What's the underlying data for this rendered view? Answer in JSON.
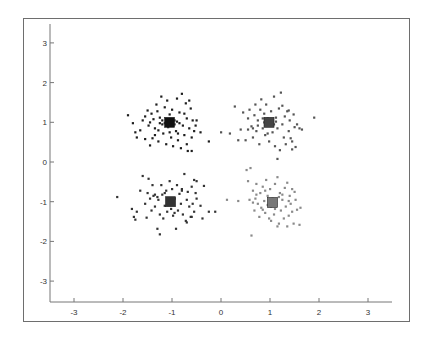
{
  "chart_data": {
    "type": "scatter",
    "title": "",
    "xlabel": "",
    "ylabel": "",
    "xlim": [
      -3.5,
      3.5
    ],
    "ylim": [
      -3.5,
      3.5
    ],
    "grid": false,
    "legend": "none",
    "x_ticks": [
      "-3",
      "-2",
      "-1",
      "0",
      "1",
      "2",
      "3"
    ],
    "y_ticks": [
      "3",
      "2",
      "1",
      "0",
      "-1",
      "-2",
      "-3"
    ],
    "x_tick_values": [
      -3,
      -2,
      -1,
      0,
      1,
      2,
      3
    ],
    "y_tick_values": [
      3,
      2,
      1,
      0,
      -1,
      -2,
      -3
    ],
    "series": [
      {
        "name": "cluster-top-left",
        "color": "#1e1e1e",
        "centroid": {
          "x": -1.05,
          "y": 1.0,
          "color": "#111111"
        },
        "points": [
          [
            -1.9,
            1.18
          ],
          [
            -1.8,
            0.98
          ],
          [
            -1.75,
            0.75
          ],
          [
            -1.72,
            0.62
          ],
          [
            -1.65,
            0.8
          ],
          [
            -1.6,
            1.05
          ],
          [
            -1.55,
            1.15
          ],
          [
            -1.5,
            1.3
          ],
          [
            -1.48,
            0.92
          ],
          [
            -1.45,
            0.42
          ],
          [
            -1.42,
            1.22
          ],
          [
            -1.4,
            0.6
          ],
          [
            -1.38,
            1.08
          ],
          [
            -1.35,
            0.85
          ],
          [
            -1.32,
            1.45
          ],
          [
            -1.3,
            1.28
          ],
          [
            -1.28,
            0.52
          ],
          [
            -1.25,
            1.12
          ],
          [
            -1.22,
            1.65
          ],
          [
            -1.2,
            0.95
          ],
          [
            -1.18,
            0.72
          ],
          [
            -1.15,
            1.38
          ],
          [
            -1.12,
            0.45
          ],
          [
            -1.1,
            1.55
          ],
          [
            -1.08,
            0.88
          ],
          [
            -1.05,
            1.2
          ],
          [
            -1.02,
            0.62
          ],
          [
            -1.0,
            1.32
          ],
          [
            -0.98,
            0.4
          ],
          [
            -0.95,
            1.05
          ],
          [
            -0.92,
            0.78
          ],
          [
            -0.9,
            1.6
          ],
          [
            -0.88,
            0.55
          ],
          [
            -0.85,
            1.25
          ],
          [
            -0.82,
            0.35
          ],
          [
            -0.8,
            1.72
          ],
          [
            -0.78,
            0.92
          ],
          [
            -0.75,
            0.68
          ],
          [
            -0.72,
            1.48
          ],
          [
            -0.7,
            1.1
          ],
          [
            -0.68,
            0.28
          ],
          [
            -0.65,
            0.85
          ],
          [
            -0.62,
            1.35
          ],
          [
            -0.6,
            0.62
          ],
          [
            -0.58,
            1.05
          ],
          [
            -0.55,
            0.78
          ],
          [
            -0.52,
            0.92
          ],
          [
            -0.5,
            1.05
          ],
          [
            -0.42,
            0.75
          ],
          [
            -0.25,
            0.52
          ],
          [
            -1.25,
            0.98
          ],
          [
            -1.15,
            0.98
          ],
          [
            -1.12,
            1.02
          ],
          [
            -0.98,
            1.0
          ],
          [
            -0.95,
            0.95
          ],
          [
            -1.1,
            0.92
          ],
          [
            -1.02,
            1.08
          ],
          [
            -0.9,
            1.02
          ],
          [
            -1.2,
            1.05
          ],
          [
            -0.85,
            0.98
          ],
          [
            -1.35,
            0.68
          ],
          [
            -0.7,
            0.45
          ],
          [
            -0.6,
            0.28
          ],
          [
            -1.45,
            1.0
          ],
          [
            -1.55,
            0.58
          ],
          [
            -0.75,
            1.22
          ],
          [
            -0.65,
            1.55
          ],
          [
            -1.28,
            0.8
          ],
          [
            -1.05,
            0.75
          ],
          [
            -0.88,
            0.72
          ]
        ]
      },
      {
        "name": "cluster-top-right",
        "color": "#555555",
        "centroid": {
          "x": 0.98,
          "y": 1.0,
          "color": "#444444"
        },
        "points": [
          [
            0.0,
            0.75
          ],
          [
            0.18,
            0.72
          ],
          [
            0.28,
            1.4
          ],
          [
            0.35,
            0.55
          ],
          [
            0.4,
            0.82
          ],
          [
            0.45,
            1.25
          ],
          [
            0.5,
            0.55
          ],
          [
            0.55,
            1.1
          ],
          [
            0.58,
            1.32
          ],
          [
            0.62,
            0.9
          ],
          [
            0.65,
            0.62
          ],
          [
            0.68,
            1.18
          ],
          [
            0.7,
            1.45
          ],
          [
            0.72,
            0.78
          ],
          [
            0.75,
            1.05
          ],
          [
            0.78,
            0.45
          ],
          [
            0.8,
            1.32
          ],
          [
            0.82,
            1.58
          ],
          [
            0.85,
            0.85
          ],
          [
            0.88,
            1.22
          ],
          [
            0.9,
            0.68
          ],
          [
            0.92,
            1.45
          ],
          [
            0.95,
            1.1
          ],
          [
            0.98,
            0.52
          ],
          [
            1.0,
            0.92
          ],
          [
            1.02,
            1.28
          ],
          [
            1.05,
            0.75
          ],
          [
            1.08,
            1.65
          ],
          [
            1.1,
            0.4
          ],
          [
            1.12,
            1.02
          ],
          [
            1.15,
            0.85
          ],
          [
            1.18,
            1.35
          ],
          [
            1.2,
            0.3
          ],
          [
            1.22,
            1.75
          ],
          [
            1.25,
            0.95
          ],
          [
            1.28,
            0.62
          ],
          [
            1.3,
            1.15
          ],
          [
            1.32,
            0.45
          ],
          [
            1.35,
            1.28
          ],
          [
            1.38,
            0.78
          ],
          [
            1.4,
            1.05
          ],
          [
            1.42,
            0.6
          ],
          [
            1.45,
            0.32
          ],
          [
            1.48,
            1.2
          ],
          [
            1.5,
            0.88
          ],
          [
            1.52,
            0.38
          ],
          [
            1.55,
            0.95
          ],
          [
            1.6,
            0.85
          ],
          [
            1.65,
            0.82
          ],
          [
            1.9,
            1.12
          ],
          [
            1.15,
            0.08
          ],
          [
            0.92,
            0.98
          ],
          [
            1.02,
            1.05
          ],
          [
            0.88,
            1.0
          ],
          [
            1.08,
            0.95
          ],
          [
            1.12,
            1.12
          ],
          [
            0.85,
            1.1
          ],
          [
            1.25,
            1.42
          ],
          [
            1.38,
            1.3
          ],
          [
            0.65,
            0.85
          ],
          [
            0.75,
            0.92
          ],
          [
            1.45,
            0.52
          ],
          [
            0.55,
            0.82
          ],
          [
            0.95,
            0.72
          ]
        ]
      },
      {
        "name": "cluster-bottom-left",
        "color": "#333333",
        "centroid": {
          "x": -1.03,
          "y": -1.0,
          "color": "#333333"
        },
        "points": [
          [
            -2.12,
            -0.88
          ],
          [
            -1.82,
            -1.18
          ],
          [
            -1.78,
            -1.38
          ],
          [
            -1.75,
            -1.45
          ],
          [
            -1.72,
            -1.25
          ],
          [
            -1.65,
            -0.72
          ],
          [
            -1.6,
            -0.35
          ],
          [
            -1.55,
            -1.05
          ],
          [
            -1.52,
            -1.4
          ],
          [
            -1.5,
            -0.78
          ],
          [
            -1.45,
            -0.92
          ],
          [
            -1.42,
            -1.22
          ],
          [
            -1.4,
            -0.58
          ],
          [
            -1.38,
            -0.85
          ],
          [
            -1.35,
            -1.12
          ],
          [
            -1.3,
            -1.68
          ],
          [
            -1.28,
            -0.95
          ],
          [
            -1.25,
            -1.32
          ],
          [
            -1.22,
            -0.58
          ],
          [
            -1.2,
            -0.82
          ],
          [
            -1.18,
            -1.42
          ],
          [
            -1.15,
            -1.1
          ],
          [
            -1.12,
            -0.72
          ],
          [
            -1.1,
            -1.25
          ],
          [
            -1.08,
            -0.95
          ],
          [
            -1.05,
            -0.48
          ],
          [
            -1.02,
            -1.18
          ],
          [
            -1.0,
            -0.68
          ],
          [
            -0.98,
            -1.35
          ],
          [
            -0.95,
            -0.92
          ],
          [
            -0.92,
            -1.68
          ],
          [
            -0.9,
            -0.58
          ],
          [
            -0.88,
            -1.22
          ],
          [
            -0.85,
            -0.8
          ],
          [
            -0.82,
            -1.05
          ],
          [
            -0.8,
            -0.68
          ],
          [
            -0.78,
            -1.32
          ],
          [
            -0.75,
            -0.3
          ],
          [
            -0.72,
            -1.48
          ],
          [
            -0.7,
            -0.95
          ],
          [
            -0.68,
            -0.75
          ],
          [
            -0.65,
            -1.12
          ],
          [
            -0.62,
            -1.38
          ],
          [
            -0.6,
            -0.62
          ],
          [
            -0.58,
            -1.05
          ],
          [
            -0.55,
            -1.25
          ],
          [
            -0.52,
            -0.78
          ],
          [
            -0.5,
            -0.92
          ],
          [
            -0.42,
            -1.1
          ],
          [
            -0.38,
            -1.42
          ],
          [
            -0.25,
            -1.25
          ],
          [
            -0.12,
            -1.25
          ],
          [
            -1.25,
            -1.82
          ],
          [
            -0.5,
            -0.48
          ],
          [
            -0.35,
            -0.6
          ],
          [
            -0.8,
            -0.72
          ],
          [
            -1.35,
            -0.82
          ],
          [
            -1.3,
            -0.88
          ],
          [
            -1.15,
            -0.78
          ],
          [
            -0.95,
            -1.28
          ],
          [
            -0.6,
            -1.38
          ],
          [
            -0.7,
            -1.52
          ],
          [
            -1.48,
            -0.42
          ],
          [
            -0.55,
            -0.45
          ]
        ]
      },
      {
        "name": "cluster-bottom-right",
        "color": "#8a8a8a",
        "centroid": {
          "x": 1.05,
          "y": -1.02,
          "color": "#777777"
        },
        "points": [
          [
            0.12,
            -0.95
          ],
          [
            0.35,
            -0.98
          ],
          [
            0.52,
            -0.2
          ],
          [
            0.55,
            -0.48
          ],
          [
            0.58,
            -0.95
          ],
          [
            0.6,
            -0.15
          ],
          [
            0.62,
            -1.85
          ],
          [
            0.65,
            -0.72
          ],
          [
            0.68,
            -1.22
          ],
          [
            0.7,
            -0.92
          ],
          [
            0.72,
            -0.55
          ],
          [
            0.75,
            -1.05
          ],
          [
            0.78,
            -1.38
          ],
          [
            0.8,
            -0.78
          ],
          [
            0.82,
            -1.15
          ],
          [
            0.85,
            -0.62
          ],
          [
            0.88,
            -0.98
          ],
          [
            0.9,
            -1.28
          ],
          [
            0.92,
            -0.45
          ],
          [
            0.95,
            -0.85
          ],
          [
            0.98,
            -1.42
          ],
          [
            1.0,
            -0.68
          ],
          [
            1.02,
            -1.12
          ],
          [
            1.05,
            -0.92
          ],
          [
            1.08,
            -1.32
          ],
          [
            1.1,
            -0.55
          ],
          [
            1.12,
            -1.05
          ],
          [
            1.15,
            -0.38
          ],
          [
            1.18,
            -1.55
          ],
          [
            1.2,
            -0.78
          ],
          [
            1.22,
            -1.22
          ],
          [
            1.25,
            -0.95
          ],
          [
            1.28,
            -1.42
          ],
          [
            1.3,
            -0.65
          ],
          [
            1.32,
            -1.12
          ],
          [
            1.35,
            -0.52
          ],
          [
            1.38,
            -1.35
          ],
          [
            1.4,
            -0.85
          ],
          [
            1.42,
            -1.05
          ],
          [
            1.45,
            -0.68
          ],
          [
            1.48,
            -1.55
          ],
          [
            1.5,
            -0.75
          ],
          [
            1.52,
            -0.95
          ],
          [
            1.55,
            -1.2
          ],
          [
            1.6,
            -1.58
          ],
          [
            1.62,
            -1.15
          ],
          [
            1.15,
            -1.62
          ],
          [
            1.35,
            -1.62
          ],
          [
            0.95,
            -1.08
          ],
          [
            1.0,
            -0.98
          ],
          [
            1.1,
            -1.18
          ],
          [
            0.85,
            -1.2
          ],
          [
            1.25,
            -0.82
          ],
          [
            0.72,
            -0.82
          ],
          [
            1.38,
            -0.98
          ],
          [
            0.9,
            -0.72
          ],
          [
            1.18,
            -0.88
          ],
          [
            0.65,
            -1.02
          ],
          [
            1.45,
            -1.25
          ],
          [
            1.02,
            -1.48
          ]
        ]
      }
    ]
  }
}
